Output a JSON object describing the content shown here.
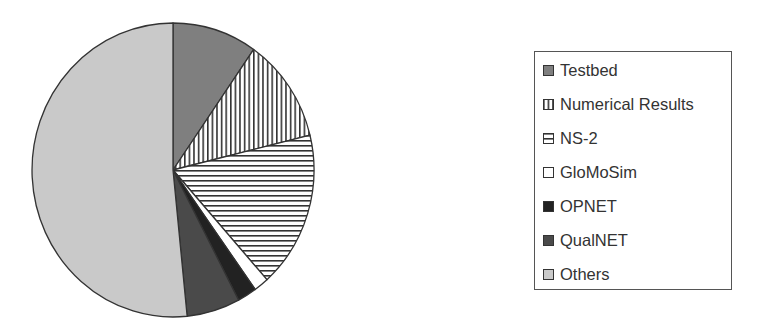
{
  "chart_data": {
    "type": "pie",
    "title": "",
    "start_angle_deg": 0,
    "direction": "clockwise",
    "categories": [
      "Testbed",
      "Numerical Results",
      "NS-2",
      "GloMoSim",
      "OPNET",
      "QualNET",
      "Others"
    ],
    "values": [
      9.7,
      11.5,
      17.2,
      1.7,
      2.2,
      6.1,
      51.6
    ],
    "unit": "percent (estimated from slice angles)",
    "slices": [
      {
        "label": "Testbed",
        "value": 9.7,
        "fill": "#7f7f7f",
        "pattern": "solid"
      },
      {
        "label": "Numerical Results",
        "value": 11.5,
        "fill": "#ffffff",
        "pattern": "vertical-stripes"
      },
      {
        "label": "NS-2",
        "value": 17.2,
        "fill": "#ffffff",
        "pattern": "horizontal-stripes"
      },
      {
        "label": "GloMoSim",
        "value": 1.7,
        "fill": "#ffffff",
        "pattern": "solid"
      },
      {
        "label": "OPNET",
        "value": 2.2,
        "fill": "#222222",
        "pattern": "solid"
      },
      {
        "label": "QualNET",
        "value": 6.1,
        "fill": "#4a4a4a",
        "pattern": "solid"
      },
      {
        "label": "Others",
        "value": 51.6,
        "fill": "#c9c9c9",
        "pattern": "solid"
      }
    ],
    "legend": {
      "position": "right",
      "entries": [
        "Testbed",
        "Numerical Results",
        "NS-2",
        "GloMoSim",
        "OPNET",
        "QualNET",
        "Others"
      ]
    }
  },
  "legend": {
    "items": [
      {
        "label": "Testbed"
      },
      {
        "label": "Numerical Results"
      },
      {
        "label": "NS-2"
      },
      {
        "label": "GloMoSim"
      },
      {
        "label": "OPNET"
      },
      {
        "label": "QualNET"
      },
      {
        "label": "Others"
      }
    ]
  }
}
